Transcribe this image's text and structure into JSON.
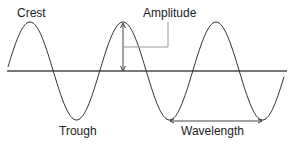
{
  "diagram": {
    "labels": {
      "crest": "Crest",
      "amplitude": "Amplitude",
      "trough": "Trough",
      "wavelength": "Wavelength"
    },
    "colors": {
      "wave": "#333333",
      "baseline": "#777777",
      "annotation": "#888888",
      "text": "#222222",
      "background": "#ffffff"
    },
    "geometry": {
      "baseline_y": 71,
      "baseline_x": [
        7,
        287
      ],
      "amplitude_px": 49,
      "period_px": 93,
      "crest_x": [
        30,
        123,
        215
      ],
      "trough_x": [
        77,
        170
      ]
    }
  }
}
